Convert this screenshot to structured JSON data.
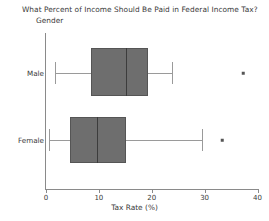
{
  "chart_data": {
    "type": "box",
    "title": "What Percent of Income Should Be Paid in Federal Income Tax?",
    "xlabel": "Tax Rate (%)",
    "ylabel": "Gender",
    "categories": [
      "Male",
      "Female"
    ],
    "xlim": [
      0,
      40
    ],
    "xticks": [
      0,
      10,
      20,
      30,
      40
    ],
    "xticklabels": [
      "0",
      "10",
      "20",
      "30",
      "40"
    ],
    "grid": false,
    "legend": false,
    "orientation": "horizontal",
    "box_fill_color": "#6e6e6e",
    "box_edge_color": "#555555",
    "whisker_color": "#9a9a9a",
    "median_color": "#3c3c3c",
    "boxes": [
      {
        "category": "Male",
        "whisker_low": 1.7,
        "q1": 8.5,
        "median": 15.2,
        "q3": 19.3,
        "whisker_high": 23.9,
        "outliers": [
          37.3
        ]
      },
      {
        "category": "Female",
        "whisker_low": 0.5,
        "q1": 4.5,
        "median": 9.7,
        "q3": 15.2,
        "whisker_high": 29.5,
        "outliers": [
          33.3
        ]
      }
    ]
  }
}
